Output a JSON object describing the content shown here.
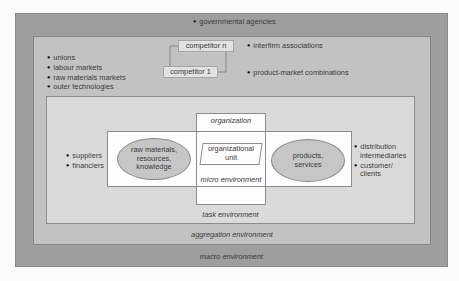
{
  "macro": {
    "title": "macro environment",
    "items": [
      "governmental agencies"
    ]
  },
  "aggregation": {
    "title": "aggregation environment",
    "left_items": [
      "unions",
      "labour markets",
      "raw materials markets",
      "outer technologies"
    ],
    "right_items": [
      "interfirm associations",
      "product-market combinations"
    ],
    "competitors": [
      "competitor n",
      "competitor 1"
    ]
  },
  "task": {
    "title": "task environment",
    "left_items": [
      "suppliers",
      "financiers"
    ],
    "right_items": [
      "distribution intermediaries",
      "customer/ clients"
    ],
    "right_lines": [
      [
        "distribution",
        "intermediaries"
      ],
      [
        "customer/",
        "clients"
      ]
    ]
  },
  "micro": {
    "title": "micro environment",
    "input_ellipse": [
      "raw materials,",
      "resources,",
      "knowledge"
    ],
    "output_ellipse": [
      "products,",
      "services"
    ]
  },
  "organization": {
    "title": "organization",
    "unit": [
      "organizational",
      "unit"
    ]
  },
  "colors": {
    "macro_bg": "#9e9e9e",
    "aggregation_bg": "#c2c2c2",
    "task_bg": "#dadada",
    "micro_bg": "#fdfdfd",
    "ellipse_bg": "#c6c6c6"
  }
}
